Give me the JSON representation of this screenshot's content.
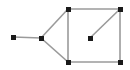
{
  "figure": {
    "width": 130,
    "height": 70,
    "background_color": "#ffffff",
    "edge_color": "#9a9a9a",
    "edge_width": 1.6,
    "vertex_color": "#1a1a1a",
    "vertex_shape": "square",
    "vertex_size": 5
  },
  "graph": {
    "vertex_count": 7,
    "edge_count": 8,
    "vertices": [
      {
        "id": "A",
        "label": "",
        "x": 13,
        "y": 37,
        "name": "vertex-a-left-endpoint"
      },
      {
        "id": "B",
        "label": "",
        "x": 41,
        "y": 38,
        "name": "vertex-b-junction"
      },
      {
        "id": "C",
        "label": "",
        "x": 68,
        "y": 9,
        "name": "vertex-c-square-top-left"
      },
      {
        "id": "D",
        "label": "",
        "x": 120,
        "y": 9,
        "name": "vertex-d-square-top-right"
      },
      {
        "id": "E",
        "label": "",
        "x": 68,
        "y": 62,
        "name": "vertex-e-square-bottom-left"
      },
      {
        "id": "F",
        "label": "",
        "x": 120,
        "y": 62,
        "name": "vertex-f-square-bottom-right"
      },
      {
        "id": "G",
        "label": "",
        "x": 90,
        "y": 38,
        "name": "vertex-g-interior"
      }
    ],
    "edges": [
      {
        "from": "A",
        "to": "B",
        "name": "edge-a-b"
      },
      {
        "from": "B",
        "to": "C",
        "name": "edge-b-c"
      },
      {
        "from": "B",
        "to": "E",
        "name": "edge-b-e"
      },
      {
        "from": "C",
        "to": "E",
        "name": "edge-c-e"
      },
      {
        "from": "C",
        "to": "D",
        "name": "edge-c-d"
      },
      {
        "from": "D",
        "to": "F",
        "name": "edge-d-f"
      },
      {
        "from": "E",
        "to": "F",
        "name": "edge-e-f"
      },
      {
        "from": "G",
        "to": "D",
        "name": "edge-g-d"
      }
    ]
  }
}
